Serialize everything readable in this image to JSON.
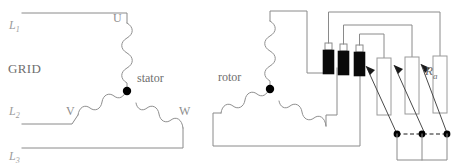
{
  "diagram": {
    "background_color": "#ffffff",
    "wire_color": "#8f8f8f",
    "node_color": "#000000",
    "slipring_color": "#0a0a0a",
    "label_color": "#8d8d8d"
  },
  "grid_section": {
    "label": "GRID",
    "phases": [
      {
        "name": "L",
        "index": "1"
      },
      {
        "name": "L",
        "index": "2"
      },
      {
        "name": "L",
        "index": "3"
      }
    ]
  },
  "stator": {
    "label": "stator",
    "terminals": [
      {
        "label": "U"
      },
      {
        "label": "V"
      },
      {
        "label": "W"
      }
    ]
  },
  "rotor": {
    "label": "rotor"
  },
  "resistor_bank": {
    "label": "R",
    "label_sub": "a",
    "count": 3,
    "type": "variable-resistor"
  },
  "slip_rings": {
    "count": 3
  }
}
